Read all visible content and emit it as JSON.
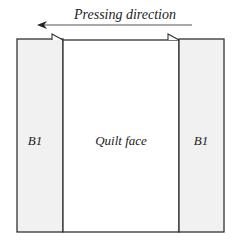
{
  "diagram": {
    "title": "Pressing direction",
    "arrow": {
      "direction": "left",
      "label": "Pressing direction"
    },
    "panels": [
      {
        "id": "left-border",
        "label": "B1",
        "fill": "#f1f1f1"
      },
      {
        "id": "center",
        "label": "Quilt face",
        "fill": "#ffffff"
      },
      {
        "id": "right-border",
        "label": "B1",
        "fill": "#f1f1f1"
      }
    ],
    "seam_allowances": [
      {
        "position": "left-seam",
        "pressed_toward": "left"
      },
      {
        "position": "right-seam",
        "pressed_toward": "left"
      }
    ],
    "colors": {
      "stroke": "#333333",
      "border_fill": "#f1f1f1",
      "center_fill": "#ffffff",
      "text": "#222222"
    }
  }
}
